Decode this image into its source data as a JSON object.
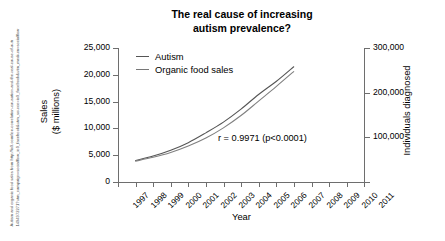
{
  "title": "The real cause of increasing autism prevalence?",
  "title_line1": "The real cause of increasing",
  "title_line2": "autism prevalence?",
  "source_caption": "Autism and organic food sales from http://io9.com/ion-correlation-causation-and-the-real-cause-of-autr 1494972271?utm_campaign=socialflow_io9_facebook&utm_source=io9_facebook&utm_medium=socialflow",
  "annotation": "r = 0.9971 (p<0.0001)",
  "legend": {
    "position": "top-left-inside",
    "items": [
      {
        "label": "Autism",
        "color": "#555555"
      },
      {
        "label": "Organic food sales",
        "color": "#777777"
      }
    ]
  },
  "axes": {
    "x_title": "Year",
    "y_left_title_line1": "Sales",
    "y_left_title_line2": "($ millions)",
    "y_right_title": "Individuals diagnosed",
    "y_left_ticks": [
      "0",
      "5,000",
      "10,000",
      "15,000",
      "20,000",
      "25,000"
    ],
    "y_right_ticks": [
      "100,000",
      "200,000",
      "300,000"
    ],
    "x_ticks": [
      "1997",
      "1998",
      "1999",
      "2000",
      "2001",
      "2002",
      "2003",
      "2004",
      "2005",
      "2006",
      "2007",
      "2008",
      "2009",
      "2010",
      "2011"
    ]
  },
  "chart_data": {
    "type": "line",
    "title": "The real cause of increasing autism prevalence?",
    "xlabel": "Year",
    "ylabel": "Sales ($ millions)",
    "ylabel_secondary": "Individuals diagnosed",
    "x": [
      1997,
      1998,
      1999,
      2000,
      2001,
      2002,
      2003,
      2004,
      2005,
      2006,
      2007,
      2008,
      2009,
      2010,
      2011
    ],
    "xlim": [
      1997,
      2011
    ],
    "ylim": [
      0,
      25000
    ],
    "ylim_secondary": [
      0,
      300000
    ],
    "grid": false,
    "legend_position": "upper left",
    "annotations": [
      "r = 0.9971 (p<0.0001)"
    ],
    "series": [
      {
        "name": "Autism",
        "axis": "right",
        "color": "#555555",
        "x": [
          1998,
          1999,
          2000,
          2001,
          2002,
          2003,
          2004,
          2005,
          2006,
          2007
        ],
        "values": [
          48000,
          58000,
          71000,
          88000,
          110000,
          134000,
          163000,
          196000,
          225000,
          258000
        ],
        "values_left_scale": [
          4000,
          4830,
          5920,
          7330,
          9170,
          11170,
          13580,
          16330,
          18750,
          21500
        ]
      },
      {
        "name": "Organic food sales",
        "axis": "left",
        "color": "#777777",
        "x": [
          1998,
          1999,
          2000,
          2001,
          2002,
          2003,
          2004,
          2005,
          2006,
          2007
        ],
        "values": [
          3900,
          4600,
          5500,
          6700,
          8200,
          10100,
          12400,
          15100,
          17800,
          20600
        ]
      }
    ]
  }
}
